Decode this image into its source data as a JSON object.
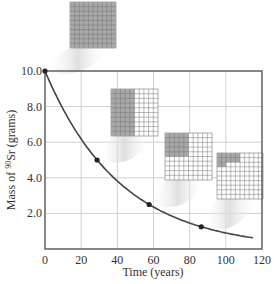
{
  "chart_data": {
    "type": "line",
    "title": "",
    "xlabel": "Time (years)",
    "ylabel_prefix": "Mass of ",
    "ylabel_isotope_mass": "90",
    "ylabel_element": "Sr",
    "ylabel_suffix": " (grams)",
    "xlim": [
      0,
      120
    ],
    "ylim": [
      0,
      10
    ],
    "grid": true,
    "x_ticks": [
      "0",
      "20",
      "40",
      "60",
      "80",
      "100",
      "120"
    ],
    "y_ticks": [
      "2.0",
      "4.0",
      "6.0",
      "8.0",
      "10.0"
    ],
    "series": [
      {
        "name": "Decay curve of 90Sr",
        "x": [
          0,
          10,
          20,
          28.8,
          40,
          57.6,
          70,
          86.4,
          100,
          115
        ],
        "values": [
          10.0,
          7.86,
          6.18,
          5.0,
          3.82,
          2.5,
          1.86,
          1.25,
          0.9,
          0.63
        ]
      }
    ],
    "marked_points": [
      {
        "x": 0,
        "y": 10.0,
        "fraction_remaining": "1"
      },
      {
        "x": 28.8,
        "y": 5.0,
        "fraction_remaining": "1/2"
      },
      {
        "x": 57.6,
        "y": 2.5,
        "fraction_remaining": "1/4"
      },
      {
        "x": 86.4,
        "y": 1.25,
        "fraction_remaining": "1/8"
      }
    ],
    "half_life_years": 28.8,
    "grid_insets": [
      {
        "cells": 100,
        "shaded": 100
      },
      {
        "cells": 100,
        "shaded": 50
      },
      {
        "cells": 100,
        "shaded": 25
      },
      {
        "cells": 100,
        "shaded": 12.5
      }
    ]
  },
  "colors": {
    "axis": "#555555",
    "curve": "#444444",
    "gridline": "#d0d0d0",
    "shaded_cell": "#a8a8a8",
    "cell_line": "#777777"
  }
}
